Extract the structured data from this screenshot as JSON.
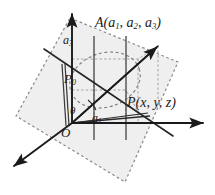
{
  "figure": {
    "width": 215,
    "height": 195,
    "background_color": "#ffffff",
    "plane_fill_color": "#f0f0f0",
    "plane_outline_color": "#808080",
    "axis_color": "#1a1a1a",
    "guide_color": "#9a9a9a"
  },
  "labels": {
    "point_A": "A(a",
    "point_A_sub1": "1",
    "point_A_mid": ", a",
    "point_A_sub2": "2",
    "point_A_mid2": ", a",
    "point_A_sub3": "3",
    "point_A_close": ")",
    "point_P": "P(x, y, z)",
    "component_a3": "a",
    "component_a3_sub": "3",
    "point_P0": "P",
    "point_P0_sub": "0",
    "component_a1": "a",
    "component_a1_sub": "1",
    "origin": "O",
    "angle_theta": "θ"
  },
  "geometry": {
    "origin": {
      "x": 72,
      "y": 123
    },
    "axes": [
      {
        "name": "z-axis",
        "to_x": 72,
        "to_y": 12
      },
      {
        "name": "y-axis",
        "to_x": 205,
        "to_y": 123
      },
      {
        "name": "x-axis",
        "to_x": 12,
        "to_y": 168
      }
    ],
    "vectors": [
      {
        "name": "OA",
        "to_x": 158,
        "to_y": 46
      },
      {
        "name": "OP",
        "to_x": 137,
        "to_y": 110
      },
      {
        "name": "OP0",
        "to_x": 94,
        "to_y": 80
      }
    ],
    "points": [
      {
        "name": "A",
        "x": 158,
        "y": 46
      },
      {
        "name": "P",
        "x": 137,
        "y": 110
      },
      {
        "name": "P0",
        "x": 94,
        "y": 80
      }
    ],
    "plane_polygon": [
      {
        "x": 70,
        "y": 18
      },
      {
        "x": 178,
        "y": 62
      },
      {
        "x": 125,
        "y": 182
      },
      {
        "x": 16,
        "y": 116
      }
    ],
    "circle_in_plane": {
      "cx": 105,
      "cy": 80,
      "rx": 36,
      "ry": 27,
      "rotation": -18
    }
  }
}
